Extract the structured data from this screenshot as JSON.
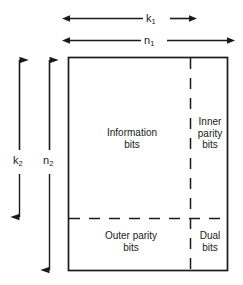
{
  "diagram": {
    "type": "product-code-block-structure",
    "regions": [
      {
        "id": "information-bits",
        "label": "Information\nbits",
        "position": "top-left"
      },
      {
        "id": "inner-parity-bits",
        "label": "Inner\nparity\nbits",
        "position": "top-right"
      },
      {
        "id": "outer-parity-bits",
        "label": "Outer parity\nbits",
        "position": "bottom-left"
      },
      {
        "id": "dual-bits",
        "label": "Dual\nbits",
        "position": "bottom-right"
      }
    ],
    "dimensions": [
      {
        "id": "k1",
        "symbol": "k",
        "subscript": "1",
        "orientation": "horizontal",
        "extent": "information-width"
      },
      {
        "id": "n1",
        "symbol": "n",
        "subscript": "1",
        "orientation": "horizontal",
        "extent": "total-width"
      },
      {
        "id": "k2",
        "symbol": "k",
        "subscript": "2",
        "orientation": "vertical",
        "extent": "information-height"
      },
      {
        "id": "n2",
        "symbol": "n",
        "subscript": "2",
        "orientation": "vertical",
        "extent": "total-height"
      }
    ],
    "colors": {
      "stroke": "#1a1a1a",
      "text": "#1a1a1a",
      "background": "#ffffff"
    },
    "geometry": {
      "rect": {
        "x": 68,
        "y": 57,
        "width": 160,
        "height": 214
      },
      "divider_vertical_x": 190,
      "divider_horizontal_y": 218
    }
  }
}
